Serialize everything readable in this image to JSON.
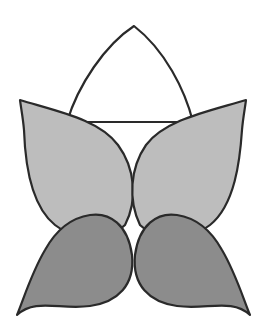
{
  "figure": {
    "colors": {
      "background": "#ffffff",
      "outline": "#2a2a2a",
      "top_petal_fill": "#ffffff",
      "upper_petals_fill": "#bdbdbd",
      "lower_petals_fill": "#8c8c8c"
    }
  }
}
